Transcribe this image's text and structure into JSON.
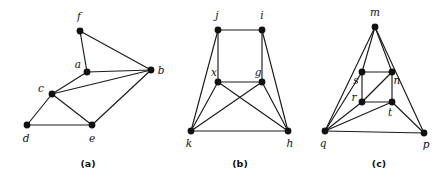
{
  "figure": {
    "background_color": "#ffffff",
    "edge_color": "#1a1a1a",
    "node_color": "#111111",
    "width": 446,
    "height": 182,
    "panels": [
      {
        "id": "panel-a",
        "caption": "(a)",
        "caption_pos": {
          "x": 88,
          "y": 167
        },
        "nodes": [
          {
            "label": "f",
            "x": 80,
            "y": 31,
            "lx": 79,
            "ly": 20
          },
          {
            "label": "a",
            "x": 87,
            "y": 72,
            "lx": 78,
            "ly": 68
          },
          {
            "label": "b",
            "x": 151,
            "y": 70,
            "lx": 161,
            "ly": 74
          },
          {
            "label": "c",
            "x": 52,
            "y": 94,
            "lx": 41,
            "ly": 92
          },
          {
            "label": "d",
            "x": 27,
            "y": 125,
            "lx": 26,
            "ly": 142
          },
          {
            "label": "e",
            "x": 92,
            "y": 125,
            "lx": 92,
            "ly": 142
          }
        ],
        "edges": [
          [
            "f",
            "a"
          ],
          [
            "f",
            "b"
          ],
          [
            "a",
            "b"
          ],
          [
            "a",
            "c"
          ],
          [
            "c",
            "b"
          ],
          [
            "c",
            "d"
          ],
          [
            "c",
            "e"
          ],
          [
            "d",
            "e"
          ],
          [
            "e",
            "b"
          ]
        ]
      },
      {
        "id": "panel-b",
        "caption": "(b)",
        "caption_pos": {
          "x": 240,
          "y": 167
        },
        "nodes": [
          {
            "label": "j",
            "x": 218,
            "y": 30,
            "lx": 217,
            "ly": 19
          },
          {
            "label": "i",
            "x": 262,
            "y": 30,
            "lx": 262,
            "ly": 19
          },
          {
            "label": "x",
            "x": 218,
            "y": 82,
            "lx": 214,
            "ly": 76
          },
          {
            "label": "g",
            "x": 262,
            "y": 82,
            "lx": 258,
            "ly": 76
          },
          {
            "label": "k",
            "x": 191,
            "y": 131,
            "lx": 189,
            "ly": 147
          },
          {
            "label": "h",
            "x": 288,
            "y": 131,
            "lx": 290,
            "ly": 147
          }
        ],
        "edges": [
          [
            "j",
            "i"
          ],
          [
            "j",
            "x"
          ],
          [
            "j",
            "k"
          ],
          [
            "i",
            "g"
          ],
          [
            "i",
            "h"
          ],
          [
            "x",
            "g"
          ],
          [
            "x",
            "k"
          ],
          [
            "x",
            "h"
          ],
          [
            "g",
            "k"
          ],
          [
            "g",
            "h"
          ],
          [
            "k",
            "h"
          ]
        ]
      },
      {
        "id": "panel-c",
        "caption": "(c)",
        "caption_pos": {
          "x": 379,
          "y": 167
        },
        "nodes": [
          {
            "label": "m",
            "x": 375,
            "y": 27,
            "lx": 375,
            "ly": 16
          },
          {
            "label": "s",
            "x": 362,
            "y": 72,
            "lx": 356,
            "ly": 84
          },
          {
            "label": "n",
            "x": 392,
            "y": 72,
            "lx": 397,
            "ly": 84
          },
          {
            "label": "r",
            "x": 362,
            "y": 102,
            "lx": 354,
            "ly": 101
          },
          {
            "label": "t",
            "x": 392,
            "y": 102,
            "lx": 390,
            "ly": 116
          },
          {
            "label": "q",
            "x": 325,
            "y": 131,
            "lx": 323,
            "ly": 147
          },
          {
            "label": "p",
            "x": 424,
            "y": 133,
            "lx": 426,
            "ly": 148
          }
        ],
        "edges": [
          [
            "m",
            "s"
          ],
          [
            "m",
            "n"
          ],
          [
            "m",
            "q"
          ],
          [
            "m",
            "p"
          ],
          [
            "s",
            "n"
          ],
          [
            "s",
            "r"
          ],
          [
            "s",
            "q"
          ],
          [
            "r",
            "n"
          ],
          [
            "r",
            "t"
          ],
          [
            "r",
            "q"
          ],
          [
            "n",
            "t"
          ],
          [
            "t",
            "q"
          ],
          [
            "t",
            "p"
          ],
          [
            "q",
            "p"
          ]
        ]
      }
    ]
  }
}
